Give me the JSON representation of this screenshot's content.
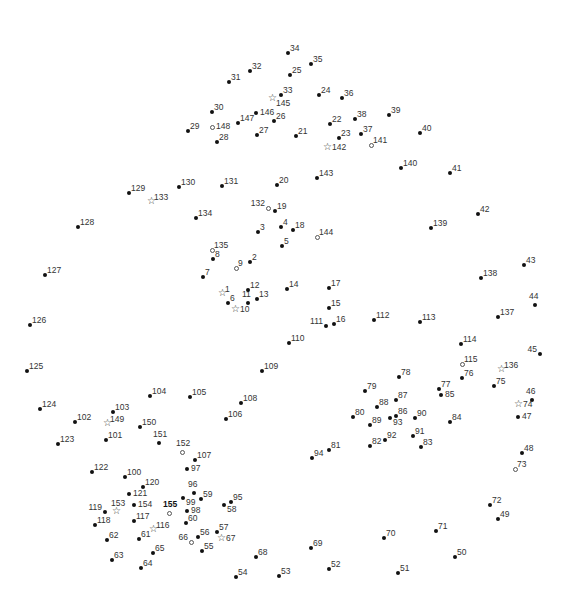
{
  "puzzle": {
    "title": "Connect the dots",
    "points": [
      {
        "n": "1",
        "x": 223,
        "y": 294,
        "m": "star",
        "p": "ne"
      },
      {
        "n": "2",
        "x": 250,
        "y": 262,
        "m": "dot",
        "p": "ne"
      },
      {
        "n": "3",
        "x": 258,
        "y": 232,
        "m": "dot",
        "p": "ne"
      },
      {
        "n": "4",
        "x": 281,
        "y": 227,
        "m": "dot",
        "p": "ne"
      },
      {
        "n": "5",
        "x": 282,
        "y": 246,
        "m": "dot",
        "p": "ne"
      },
      {
        "n": "6",
        "x": 228,
        "y": 303,
        "m": "dot",
        "p": "ne"
      },
      {
        "n": "7",
        "x": 203,
        "y": 277,
        "m": "dot",
        "p": "ne"
      },
      {
        "n": "8",
        "x": 213,
        "y": 259,
        "m": "dot",
        "p": "ne"
      },
      {
        "n": "9",
        "x": 236,
        "y": 268,
        "m": "open",
        "p": "ne"
      },
      {
        "n": "10",
        "x": 236,
        "y": 310,
        "m": "star",
        "p": "e"
      },
      {
        "n": "11",
        "x": 248,
        "y": 303,
        "m": "dot",
        "p": "n"
      },
      {
        "n": "12",
        "x": 248,
        "y": 290,
        "m": "dot",
        "p": "ne"
      },
      {
        "n": "13",
        "x": 257,
        "y": 299,
        "m": "dot",
        "p": "ne"
      },
      {
        "n": "14",
        "x": 287,
        "y": 289,
        "m": "dot",
        "p": "ne"
      },
      {
        "n": "15",
        "x": 329,
        "y": 308,
        "m": "dot",
        "p": "ne"
      },
      {
        "n": "16",
        "x": 334,
        "y": 324,
        "m": "dot",
        "p": "ne"
      },
      {
        "n": "17",
        "x": 329,
        "y": 288,
        "m": "dot",
        "p": "ne"
      },
      {
        "n": "18",
        "x": 293,
        "y": 230,
        "m": "dot",
        "p": "ne"
      },
      {
        "n": "19",
        "x": 275,
        "y": 211,
        "m": "dot",
        "p": "ne"
      },
      {
        "n": "20",
        "x": 277,
        "y": 185,
        "m": "dot",
        "p": "ne"
      },
      {
        "n": "21",
        "x": 296,
        "y": 136,
        "m": "dot",
        "p": "ne"
      },
      {
        "n": "22",
        "x": 330,
        "y": 124,
        "m": "dot",
        "p": "ne"
      },
      {
        "n": "23",
        "x": 339,
        "y": 138,
        "m": "dot",
        "p": "ne"
      },
      {
        "n": "24",
        "x": 319,
        "y": 95,
        "m": "dot",
        "p": "ne"
      },
      {
        "n": "25",
        "x": 290,
        "y": 75,
        "m": "dot",
        "p": "ne"
      },
      {
        "n": "26",
        "x": 274,
        "y": 121,
        "m": "dot",
        "p": "ne"
      },
      {
        "n": "27",
        "x": 257,
        "y": 135,
        "m": "dot",
        "p": "ne"
      },
      {
        "n": "28",
        "x": 217,
        "y": 142,
        "m": "dot",
        "p": "ne"
      },
      {
        "n": "29",
        "x": 188,
        "y": 131,
        "m": "dot",
        "p": "ne"
      },
      {
        "n": "30",
        "x": 212,
        "y": 112,
        "m": "dot",
        "p": "ne"
      },
      {
        "n": "31",
        "x": 229,
        "y": 82,
        "m": "dot",
        "p": "ne"
      },
      {
        "n": "32",
        "x": 250,
        "y": 71,
        "m": "dot",
        "p": "ne"
      },
      {
        "n": "33",
        "x": 281,
        "y": 95,
        "m": "dot",
        "p": "ne"
      },
      {
        "n": "34",
        "x": 288,
        "y": 53,
        "m": "dot",
        "p": "ne"
      },
      {
        "n": "35",
        "x": 311,
        "y": 64,
        "m": "dot",
        "p": "ne"
      },
      {
        "n": "36",
        "x": 342,
        "y": 98,
        "m": "dot",
        "p": "ne"
      },
      {
        "n": "37",
        "x": 361,
        "y": 134,
        "m": "dot",
        "p": "ne"
      },
      {
        "n": "38",
        "x": 355,
        "y": 119,
        "m": "dot",
        "p": "ne"
      },
      {
        "n": "39",
        "x": 389,
        "y": 115,
        "m": "dot",
        "p": "ne"
      },
      {
        "n": "40",
        "x": 420,
        "y": 133,
        "m": "dot",
        "p": "ne"
      },
      {
        "n": "41",
        "x": 450,
        "y": 173,
        "m": "dot",
        "p": "ne"
      },
      {
        "n": "42",
        "x": 478,
        "y": 214,
        "m": "dot",
        "p": "ne"
      },
      {
        "n": "43",
        "x": 524,
        "y": 265,
        "m": "dot",
        "p": "ne"
      },
      {
        "n": "44",
        "x": 535,
        "y": 305,
        "m": "dot",
        "p": "n"
      },
      {
        "n": "45",
        "x": 540,
        "y": 354,
        "m": "dot",
        "p": "nw"
      },
      {
        "n": "46",
        "x": 532,
        "y": 400,
        "m": "dot",
        "p": "n"
      },
      {
        "n": "47",
        "x": 518,
        "y": 417,
        "m": "dot",
        "p": "e"
      },
      {
        "n": "48",
        "x": 522,
        "y": 453,
        "m": "dot",
        "p": "ne"
      },
      {
        "n": "49",
        "x": 498,
        "y": 519,
        "m": "dot",
        "p": "ne"
      },
      {
        "n": "50",
        "x": 455,
        "y": 557,
        "m": "dot",
        "p": "ne"
      },
      {
        "n": "51",
        "x": 398,
        "y": 573,
        "m": "dot",
        "p": "ne"
      },
      {
        "n": "52",
        "x": 329,
        "y": 569,
        "m": "dot",
        "p": "ne"
      },
      {
        "n": "53",
        "x": 279,
        "y": 576,
        "m": "dot",
        "p": "ne"
      },
      {
        "n": "54",
        "x": 236,
        "y": 577,
        "m": "dot",
        "p": "ne"
      },
      {
        "n": "55",
        "x": 202,
        "y": 551,
        "m": "dot",
        "p": "ne"
      },
      {
        "n": "56",
        "x": 198,
        "y": 537,
        "m": "dot",
        "p": "ne"
      },
      {
        "n": "57",
        "x": 217,
        "y": 532,
        "m": "dot",
        "p": "ne"
      },
      {
        "n": "58",
        "x": 224,
        "y": 505,
        "m": "dot",
        "p": "se"
      },
      {
        "n": "59",
        "x": 201,
        "y": 499,
        "m": "dot",
        "p": "ne"
      },
      {
        "n": "60",
        "x": 186,
        "y": 523,
        "m": "dot",
        "p": "ne"
      },
      {
        "n": "61",
        "x": 139,
        "y": 539,
        "m": "dot",
        "p": "ne"
      },
      {
        "n": "62",
        "x": 107,
        "y": 540,
        "m": "dot",
        "p": "ne"
      },
      {
        "n": "63",
        "x": 112,
        "y": 560,
        "m": "dot",
        "p": "ne"
      },
      {
        "n": "64",
        "x": 141,
        "y": 568,
        "m": "dot",
        "p": "ne"
      },
      {
        "n": "65",
        "x": 153,
        "y": 553,
        "m": "dot",
        "p": "ne"
      },
      {
        "n": "66",
        "x": 191,
        "y": 542,
        "m": "open",
        "p": "nw"
      },
      {
        "n": "67",
        "x": 222,
        "y": 539,
        "m": "star",
        "p": "e"
      },
      {
        "n": "68",
        "x": 256,
        "y": 557,
        "m": "dot",
        "p": "ne"
      },
      {
        "n": "69",
        "x": 311,
        "y": 548,
        "m": "dot",
        "p": "ne"
      },
      {
        "n": "70",
        "x": 384,
        "y": 538,
        "m": "dot",
        "p": "ne"
      },
      {
        "n": "71",
        "x": 436,
        "y": 531,
        "m": "dot",
        "p": "ne"
      },
      {
        "n": "72",
        "x": 490,
        "y": 505,
        "m": "dot",
        "p": "ne"
      },
      {
        "n": "73",
        "x": 515,
        "y": 469,
        "m": "open",
        "p": "ne"
      },
      {
        "n": "74",
        "x": 519,
        "y": 405,
        "m": "star",
        "p": "e"
      },
      {
        "n": "75",
        "x": 494,
        "y": 386,
        "m": "dot",
        "p": "ne"
      },
      {
        "n": "76",
        "x": 462,
        "y": 378,
        "m": "dot",
        "p": "ne"
      },
      {
        "n": "77",
        "x": 439,
        "y": 389,
        "m": "dot",
        "p": "ne"
      },
      {
        "n": "78",
        "x": 399,
        "y": 377,
        "m": "dot",
        "p": "ne"
      },
      {
        "n": "79",
        "x": 365,
        "y": 391,
        "m": "dot",
        "p": "ne"
      },
      {
        "n": "80",
        "x": 353,
        "y": 417,
        "m": "dot",
        "p": "ne"
      },
      {
        "n": "81",
        "x": 329,
        "y": 450,
        "m": "dot",
        "p": "ne"
      },
      {
        "n": "82",
        "x": 370,
        "y": 446,
        "m": "dot",
        "p": "ne"
      },
      {
        "n": "83",
        "x": 421,
        "y": 447,
        "m": "dot",
        "p": "ne"
      },
      {
        "n": "84",
        "x": 450,
        "y": 422,
        "m": "dot",
        "p": "ne"
      },
      {
        "n": "85",
        "x": 441,
        "y": 395,
        "m": "dot",
        "p": "e"
      },
      {
        "n": "86",
        "x": 396,
        "y": 416,
        "m": "dot",
        "p": "ne"
      },
      {
        "n": "87",
        "x": 396,
        "y": 400,
        "m": "dot",
        "p": "ne"
      },
      {
        "n": "88",
        "x": 377,
        "y": 407,
        "m": "dot",
        "p": "ne"
      },
      {
        "n": "89",
        "x": 370,
        "y": 425,
        "m": "dot",
        "p": "ne"
      },
      {
        "n": "90",
        "x": 415,
        "y": 418,
        "m": "dot",
        "p": "ne"
      },
      {
        "n": "91",
        "x": 413,
        "y": 436,
        "m": "dot",
        "p": "ne"
      },
      {
        "n": "92",
        "x": 385,
        "y": 440,
        "m": "dot",
        "p": "ne"
      },
      {
        "n": "93",
        "x": 390,
        "y": 418,
        "m": "dot",
        "p": "se"
      },
      {
        "n": "94",
        "x": 312,
        "y": 458,
        "m": "dot",
        "p": "ne"
      },
      {
        "n": "95",
        "x": 231,
        "y": 502,
        "m": "dot",
        "p": "ne"
      },
      {
        "n": "96",
        "x": 194,
        "y": 493,
        "m": "dot",
        "p": "n"
      },
      {
        "n": "97",
        "x": 187,
        "y": 469,
        "m": "dot",
        "p": "e"
      },
      {
        "n": "98",
        "x": 187,
        "y": 511,
        "m": "dot",
        "p": "e"
      },
      {
        "n": "99",
        "x": 183,
        "y": 498,
        "m": "dot",
        "p": "se"
      },
      {
        "n": "100",
        "x": 125,
        "y": 477,
        "m": "dot",
        "p": "ne"
      },
      {
        "n": "101",
        "x": 106,
        "y": 440,
        "m": "dot",
        "p": "ne"
      },
      {
        "n": "102",
        "x": 75,
        "y": 422,
        "m": "dot",
        "p": "ne"
      },
      {
        "n": "103",
        "x": 113,
        "y": 412,
        "m": "dot",
        "p": "ne"
      },
      {
        "n": "104",
        "x": 150,
        "y": 396,
        "m": "dot",
        "p": "ne"
      },
      {
        "n": "105",
        "x": 190,
        "y": 397,
        "m": "dot",
        "p": "ne"
      },
      {
        "n": "106",
        "x": 226,
        "y": 419,
        "m": "dot",
        "p": "ne"
      },
      {
        "n": "107",
        "x": 195,
        "y": 460,
        "m": "dot",
        "p": "ne"
      },
      {
        "n": "108",
        "x": 241,
        "y": 403,
        "m": "dot",
        "p": "ne"
      },
      {
        "n": "109",
        "x": 262,
        "y": 371,
        "m": "dot",
        "p": "ne"
      },
      {
        "n": "110",
        "x": 289,
        "y": 343,
        "m": "dot",
        "p": "ne"
      },
      {
        "n": "111",
        "x": 326,
        "y": 326,
        "m": "dot",
        "p": "nw"
      },
      {
        "n": "112",
        "x": 374,
        "y": 320,
        "m": "dot",
        "p": "ne"
      },
      {
        "n": "113",
        "x": 420,
        "y": 322,
        "m": "dot",
        "p": "ne"
      },
      {
        "n": "114",
        "x": 461,
        "y": 344,
        "m": "dot",
        "p": "ne"
      },
      {
        "n": "115",
        "x": 462,
        "y": 364,
        "m": "open",
        "p": "ne"
      },
      {
        "n": "116",
        "x": 154,
        "y": 530,
        "m": "star",
        "p": "ne"
      },
      {
        "n": "117",
        "x": 134,
        "y": 521,
        "m": "dot",
        "p": "ne"
      },
      {
        "n": "118",
        "x": 95,
        "y": 525,
        "m": "dot",
        "p": "ne"
      },
      {
        "n": "119",
        "x": 105,
        "y": 512,
        "m": "dot",
        "p": "nw"
      },
      {
        "n": "120",
        "x": 143,
        "y": 487,
        "m": "dot",
        "p": "ne"
      },
      {
        "n": "121",
        "x": 129,
        "y": 494,
        "m": "dot",
        "p": "e"
      },
      {
        "n": "122",
        "x": 92,
        "y": 472,
        "m": "dot",
        "p": "ne"
      },
      {
        "n": "123",
        "x": 58,
        "y": 444,
        "m": "dot",
        "p": "ne"
      },
      {
        "n": "124",
        "x": 40,
        "y": 409,
        "m": "dot",
        "p": "ne"
      },
      {
        "n": "125",
        "x": 27,
        "y": 371,
        "m": "dot",
        "p": "ne"
      },
      {
        "n": "126",
        "x": 30,
        "y": 325,
        "m": "dot",
        "p": "ne"
      },
      {
        "n": "127",
        "x": 45,
        "y": 275,
        "m": "dot",
        "p": "ne"
      },
      {
        "n": "128",
        "x": 78,
        "y": 227,
        "m": "dot",
        "p": "ne"
      },
      {
        "n": "129",
        "x": 129,
        "y": 193,
        "m": "dot",
        "p": "ne"
      },
      {
        "n": "130",
        "x": 179,
        "y": 187,
        "m": "dot",
        "p": "ne"
      },
      {
        "n": "131",
        "x": 222,
        "y": 186,
        "m": "dot",
        "p": "ne"
      },
      {
        "n": "132",
        "x": 268,
        "y": 208,
        "m": "open",
        "p": "nw"
      },
      {
        "n": "133",
        "x": 152,
        "y": 202,
        "m": "star",
        "p": "ne"
      },
      {
        "n": "134",
        "x": 196,
        "y": 218,
        "m": "dot",
        "p": "ne"
      },
      {
        "n": "135",
        "x": 212,
        "y": 250,
        "m": "open",
        "p": "ne"
      },
      {
        "n": "136",
        "x": 502,
        "y": 370,
        "m": "star",
        "p": "ne"
      },
      {
        "n": "137",
        "x": 498,
        "y": 317,
        "m": "dot",
        "p": "ne"
      },
      {
        "n": "138",
        "x": 481,
        "y": 278,
        "m": "dot",
        "p": "ne"
      },
      {
        "n": "139",
        "x": 431,
        "y": 228,
        "m": "dot",
        "p": "ne"
      },
      {
        "n": "140",
        "x": 401,
        "y": 168,
        "m": "dot",
        "p": "ne"
      },
      {
        "n": "141",
        "x": 371,
        "y": 145,
        "m": "open",
        "p": "ne"
      },
      {
        "n": "142",
        "x": 328,
        "y": 148,
        "m": "star",
        "p": "e"
      },
      {
        "n": "143",
        "x": 317,
        "y": 178,
        "m": "dot",
        "p": "ne"
      },
      {
        "n": "144",
        "x": 317,
        "y": 237,
        "m": "open",
        "p": "ne"
      },
      {
        "n": "145",
        "x": 273,
        "y": 99,
        "m": "star",
        "p": "se"
      },
      {
        "n": "146",
        "x": 256,
        "y": 113,
        "m": "dot",
        "p": "e"
      },
      {
        "n": "147",
        "x": 238,
        "y": 123,
        "m": "dot",
        "p": "ne"
      },
      {
        "n": "148",
        "x": 212,
        "y": 127,
        "m": "open",
        "p": "e"
      },
      {
        "n": "149",
        "x": 108,
        "y": 424,
        "m": "star",
        "p": "ne"
      },
      {
        "n": "150",
        "x": 140,
        "y": 427,
        "m": "dot",
        "p": "ne"
      },
      {
        "n": "151",
        "x": 159,
        "y": 443,
        "m": "dot",
        "p": "n"
      },
      {
        "n": "152",
        "x": 182,
        "y": 452,
        "m": "open",
        "p": "n"
      },
      {
        "n": "153",
        "x": 117,
        "y": 512,
        "m": "star",
        "p": "n"
      },
      {
        "n": "154",
        "x": 134,
        "y": 505,
        "m": "dot",
        "p": "e"
      },
      {
        "n": "155",
        "x": 169,
        "y": 513,
        "m": "open",
        "p": "n",
        "bold": true
      }
    ]
  }
}
